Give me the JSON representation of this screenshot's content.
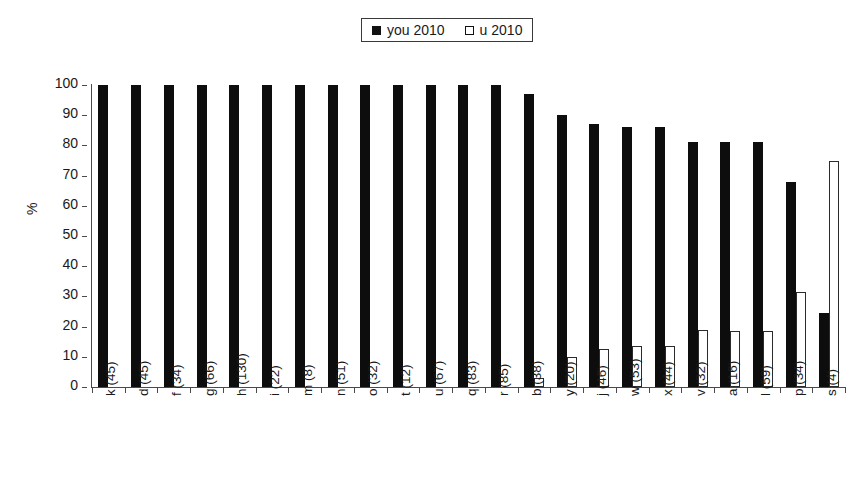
{
  "legend": {
    "position": "top-center",
    "entries": [
      {
        "label": "you 2010",
        "marker": "filled-square-icon",
        "color": "#0d0d0d"
      },
      {
        "label": "u 2010",
        "marker": "hollow-square-icon",
        "color": "#ffffff"
      }
    ]
  },
  "axes": {
    "y_title": "%",
    "y_ticks": [
      "100",
      "90",
      "80",
      "70",
      "60",
      "50",
      "40",
      "30",
      "20",
      "10",
      "0"
    ]
  },
  "chart_data": {
    "type": "bar",
    "title": "",
    "xlabel": "",
    "ylabel": "%",
    "ylim": [
      0,
      100
    ],
    "grid": false,
    "legend_position": "top-center",
    "categories": [
      "k (45)",
      "d (45)",
      "f (34)",
      "g (66)",
      "h (130)",
      "i (22)",
      "m (8)",
      "n (51)",
      "o (32)",
      "t (12)",
      "u (67)",
      "q (83)",
      "r (85)",
      "b (38)",
      "y (20)",
      "j (46)",
      "w (53)",
      "x (44)",
      "v (32)",
      "a (16)",
      "l (59)",
      "p (34)",
      "s (4)"
    ],
    "series": [
      {
        "name": "you 2010",
        "color": "#0d0d0d",
        "values": [
          100,
          100,
          100,
          100,
          100,
          100,
          100,
          100,
          100,
          100,
          100,
          100,
          100,
          97,
          90,
          87,
          86,
          86,
          81,
          81,
          81,
          68,
          24.5
        ]
      },
      {
        "name": "u 2010",
        "color": "#ffffff",
        "values": [
          0,
          0,
          0,
          0,
          0,
          0,
          0,
          0,
          0,
          0,
          0,
          0,
          0,
          3,
          10,
          12.5,
          13.5,
          13.5,
          19,
          18.5,
          18.5,
          31.5,
          75
        ]
      }
    ]
  }
}
